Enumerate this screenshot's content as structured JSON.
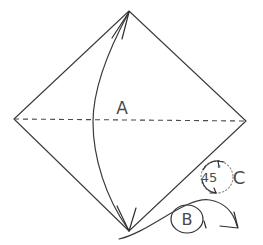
{
  "figure": {
    "background_color": "#ffffff",
    "line_color": "#3a3a3a",
    "dashed_color": "#4a4a4a",
    "dotted_color": "#8a8a8a"
  },
  "labels": {
    "a": "A",
    "b": "B",
    "c": "C",
    "angle_value": "45",
    "angle_unit": "°"
  },
  "shapes": {
    "kite": {
      "name": "kite-outline",
      "vertices": [
        {
          "id": "top",
          "x": 129,
          "y": 11
        },
        {
          "id": "right",
          "x": 246,
          "y": 121
        },
        {
          "id": "bottom",
          "x": 129,
          "y": 231
        },
        {
          "id": "left",
          "x": 14,
          "y": 119
        }
      ]
    },
    "fold_axis": {
      "name": "horizontal-dashed-axis",
      "from": {
        "x": 14,
        "y": 119
      },
      "to": {
        "x": 246,
        "y": 121
      }
    },
    "fold_arc": {
      "name": "vertical-fold-arc",
      "from": {
        "x": 129,
        "y": 11
      },
      "to": {
        "x": 129,
        "y": 231
      },
      "bulge_x": 93
    },
    "rotation_marker": {
      "name": "rotation-45-degree",
      "center": {
        "x": 217,
        "y": 177
      },
      "radius": 16
    },
    "b_marker": {
      "name": "b-circle",
      "center": {
        "x": 187,
        "y": 219
      },
      "radius_x": 16,
      "radius_y": 14
    },
    "b_arrow": {
      "name": "b-sweep-arrow",
      "from": {
        "x": 119,
        "y": 239
      },
      "to": {
        "x": 238,
        "y": 228
      }
    }
  }
}
